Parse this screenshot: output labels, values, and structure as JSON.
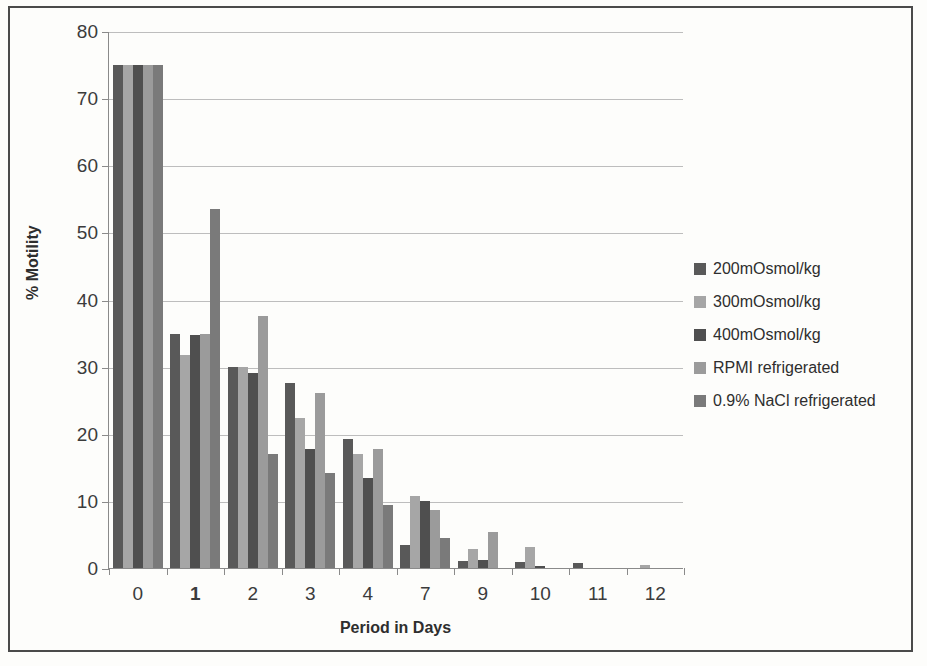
{
  "chart_data": {
    "type": "bar",
    "title": "",
    "xlabel": "Period in Days",
    "ylabel": "% Motility",
    "ylim": [
      0,
      80
    ],
    "ytick_labels": [
      "0",
      "10",
      "20",
      "30",
      "40",
      "50",
      "60",
      "70",
      "80"
    ],
    "ytick_values": [
      0,
      10,
      20,
      30,
      40,
      50,
      60,
      70,
      80
    ],
    "grid": true,
    "legend_position": "right",
    "categories": [
      "0",
      "1",
      "2",
      "3",
      "4",
      "7",
      "9",
      "10",
      "11",
      "12"
    ],
    "emphasized_categories": [
      "1"
    ],
    "series": [
      {
        "name": "200mOsmol/kg",
        "color": "#595959",
        "values": [
          75,
          34.8,
          30,
          27.5,
          19.2,
          3.4,
          1.1,
          0.9,
          0.7,
          0
        ]
      },
      {
        "name": "300mOsmol/kg",
        "color": "#a6a6a6",
        "values": [
          75,
          31.8,
          30,
          22.3,
          17,
          10.8,
          2.9,
          3.1,
          0,
          0.4
        ]
      },
      {
        "name": "400mOsmol/kg",
        "color": "#4f4f4f",
        "values": [
          75,
          34.7,
          29,
          17.8,
          13.4,
          10,
          1.2,
          0.3,
          0,
          0
        ]
      },
      {
        "name": "RPMI refrigerated",
        "color": "#9b9b9b",
        "values": [
          75,
          34.8,
          37.5,
          26,
          17.8,
          8.6,
          5.4,
          0,
          0,
          0
        ]
      },
      {
        "name": "0.9% NaCl refrigerated",
        "color": "#7a7a7a",
        "values": [
          75,
          53.5,
          17,
          14.2,
          9.4,
          4.5,
          0,
          0,
          0,
          0
        ]
      }
    ]
  }
}
